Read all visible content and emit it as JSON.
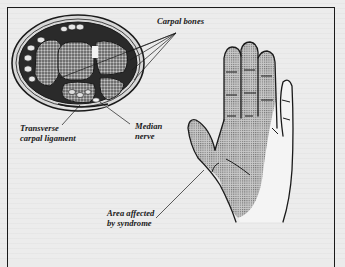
{
  "figure": {
    "type": "anatomical-diagram",
    "panels": [
      {
        "name": "wrist-cross-section"
      },
      {
        "name": "palm-of-hand"
      }
    ],
    "labels": {
      "carpal_bones": "Carpal bones",
      "transverse_ligament": "Transverse\ncarpal ligament",
      "median_nerve": "Median\nnerve",
      "affected_area": "Area affected\nby syndrome"
    },
    "colors": {
      "ink": "#1a1a1a",
      "paper": "#ececec",
      "stipple": "#8a8a8a"
    }
  }
}
